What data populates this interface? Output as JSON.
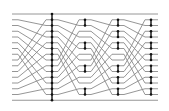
{
  "diagram": {
    "type": "sorting-network-shuffle",
    "num_wires": 16,
    "wire_y_start": 14,
    "wire_spacing": 5.75,
    "x_start": 12,
    "x_end": 158,
    "colors": {
      "wire": "#8a8a8a",
      "comparator": "#111111",
      "background": "#ffffff"
    },
    "stages": [
      {
        "x": 52,
        "span": [
          0,
          15
        ],
        "dots": [
          0,
          1,
          2,
          3,
          4,
          5,
          6,
          7,
          8,
          9,
          10,
          11,
          12,
          13,
          14,
          15
        ]
      },
      {
        "x": 85,
        "pairs": [
          [
            1,
            2
          ],
          [
            5,
            6
          ],
          [
            9,
            10
          ],
          [
            13,
            14
          ]
        ]
      },
      {
        "x": 118,
        "pairs": [
          [
            1,
            2
          ],
          [
            3,
            4
          ],
          [
            5,
            6
          ],
          [
            9,
            10
          ],
          [
            11,
            12
          ],
          [
            13,
            14
          ]
        ]
      },
      {
        "x": 151,
        "pairs": [
          [
            1,
            2
          ],
          [
            3,
            4
          ],
          [
            5,
            6
          ],
          [
            7,
            8
          ],
          [
            9,
            10
          ],
          [
            11,
            12
          ],
          [
            13,
            14
          ]
        ]
      }
    ],
    "shuffle_segments": [
      {
        "from_x": 18,
        "to_x": 46
      },
      {
        "from_x": 58,
        "to_x": 79
      },
      {
        "from_x": 91,
        "to_x": 112
      },
      {
        "from_x": 124,
        "to_x": 145
      }
    ]
  }
}
